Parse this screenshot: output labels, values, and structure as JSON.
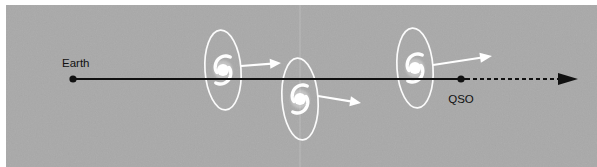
{
  "figure": {
    "canvas": {
      "width": 597,
      "height": 167
    },
    "background": {
      "panel_color": "#a9a9a9",
      "page_color": "#ffffff",
      "panel_rect": {
        "x": 6,
        "y": 5,
        "width": 591,
        "height": 162
      }
    }
  },
  "labels": {
    "earth": "Earth",
    "qso": "QSO"
  },
  "colors": {
    "sightline": "#111111",
    "galaxy": "#ffffff",
    "arrow_galaxy": "#ffffff",
    "label_text": "#111111",
    "panel": "#a9a9a9"
  },
  "sightline": {
    "name": "line-of-sight",
    "solid": {
      "x1": 73,
      "y1": 79,
      "x2": 466,
      "y2": 79
    },
    "dashed": {
      "x1": 466,
      "y1": 79,
      "x2": 560,
      "y2": 79
    },
    "dash_pattern": "4 3",
    "stroke_width": 2,
    "arrowhead": {
      "tip_x": 578,
      "tip_y": 79,
      "back_x": 558,
      "half_height": 6
    }
  },
  "endpoints": [
    {
      "id": "earth",
      "name": "earth-marker",
      "label": "Earth",
      "dot": {
        "cx": 73,
        "cy": 79,
        "r": 3.6
      },
      "label_pos": {
        "x": 62,
        "y": 67
      },
      "label_anchor": "start"
    },
    {
      "id": "qso",
      "name": "qso-marker",
      "label": "QSO",
      "dot": {
        "cx": 461,
        "cy": 79,
        "r": 3.6
      },
      "label_pos": {
        "x": 461,
        "y": 103
      },
      "label_anchor": "middle"
    }
  ],
  "galaxies": [
    {
      "id": "galaxy-1",
      "name": "intervening-galaxy-1",
      "center": {
        "cx": 223,
        "cy": 70
      },
      "halo": {
        "rx": 18,
        "ry": 40,
        "rotate": -4
      },
      "core_r": 6.0,
      "arrow": {
        "x1": 241,
        "y1": 66,
        "x2": 281,
        "y2": 63,
        "head_len": 11,
        "head_half": 5
      }
    },
    {
      "id": "galaxy-2",
      "name": "intervening-galaxy-2",
      "center": {
        "cx": 300,
        "cy": 99
      },
      "halo": {
        "rx": 18,
        "ry": 41,
        "rotate": -4
      },
      "core_r": 6.0,
      "arrow": {
        "x1": 318,
        "y1": 96,
        "x2": 361,
        "y2": 103,
        "head_len": 11,
        "head_half": 5
      }
    },
    {
      "id": "galaxy-3",
      "name": "intervening-galaxy-3",
      "center": {
        "cx": 415,
        "cy": 68
      },
      "halo": {
        "rx": 18,
        "ry": 40,
        "rotate": -4
      },
      "core_r": 6.0,
      "arrow": {
        "x1": 433,
        "y1": 65,
        "x2": 492,
        "y2": 56,
        "head_len": 12,
        "head_half": 5
      }
    }
  ]
}
